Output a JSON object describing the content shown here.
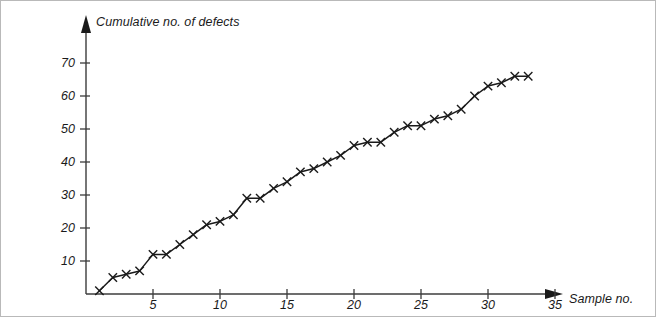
{
  "chart_data": {
    "type": "line",
    "title": "",
    "subtitle": "",
    "xlabel": "Sample no.",
    "ylabel": "Cumulative no. of defects",
    "x": [
      1,
      2,
      3,
      4,
      5,
      6,
      7,
      8,
      9,
      10,
      11,
      12,
      13,
      14,
      15,
      16,
      17,
      18,
      19,
      20,
      21,
      22,
      23,
      24,
      25,
      26,
      27,
      28,
      29,
      30,
      31,
      32,
      33
    ],
    "values": [
      1,
      5,
      6,
      7,
      12,
      12,
      15,
      18,
      21,
      22,
      24,
      29,
      29,
      32,
      34,
      37,
      38,
      40,
      42,
      45,
      46,
      46,
      49,
      51,
      51,
      53,
      54,
      56,
      60,
      63,
      64,
      66,
      66
    ],
    "series": [
      {
        "name": "Cumulative no. of defects",
        "values": [
          1,
          5,
          6,
          7,
          12,
          12,
          15,
          18,
          21,
          22,
          24,
          29,
          29,
          32,
          34,
          37,
          38,
          40,
          42,
          45,
          46,
          46,
          49,
          51,
          51,
          53,
          54,
          56,
          60,
          63,
          64,
          66,
          66
        ]
      }
    ],
    "marker": "x-cross",
    "line_color": "#1a1a1a",
    "marker_color": "#1a1a1a",
    "xlim": [
      0,
      38
    ],
    "ylim": [
      0,
      76
    ],
    "xticks": [
      5,
      10,
      15,
      20,
      25,
      30,
      35
    ],
    "yticks": [
      10,
      20,
      30,
      40,
      50,
      60,
      70
    ],
    "xtick_labels": [
      "5",
      "10",
      "15",
      "20",
      "25",
      "30",
      "35"
    ],
    "ytick_labels": [
      "10",
      "20",
      "30",
      "40",
      "50",
      "60",
      "70"
    ],
    "grid": false,
    "legend": false,
    "legend_position": "none",
    "axis_style": "arrow-tipped-l-axes",
    "annotations": []
  },
  "figure": {
    "border_color": "#b9b9b9",
    "background": "#ffffff",
    "axis_color": "#3c3c3c"
  }
}
